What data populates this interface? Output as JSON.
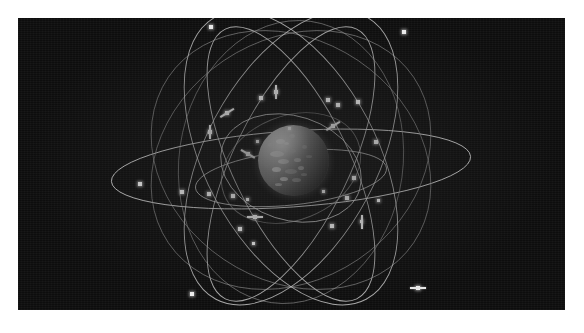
{
  "figure": {
    "kind": "orbital-constellation-illustration",
    "background_color": "#0d0d0d",
    "frame_color": "#ffffff",
    "orbit_stroke_color": "#cfcfcf",
    "satellite_color": "#f2f2f2",
    "earth_color": "#8a8a8a",
    "panel_rect": {
      "x": 18,
      "y": 18,
      "width": 547,
      "height": 292
    }
  },
  "earth": {
    "label": "earth-globe",
    "center_x": 291,
    "center_y": 159,
    "radius": 35,
    "landmasses": [
      {
        "x": 18,
        "y": 14,
        "w": 9,
        "h": 5,
        "dim": false
      },
      {
        "x": 31,
        "y": 9,
        "w": 6,
        "h": 4,
        "dim": true
      },
      {
        "x": 12,
        "y": 26,
        "w": 14,
        "h": 6,
        "dim": false
      },
      {
        "x": 30,
        "y": 24,
        "w": 8,
        "h": 4,
        "dim": true
      },
      {
        "x": 20,
        "y": 34,
        "w": 11,
        "h": 5,
        "dim": false
      },
      {
        "x": 36,
        "y": 33,
        "w": 7,
        "h": 4,
        "dim": false
      },
      {
        "x": 14,
        "y": 42,
        "w": 9,
        "h": 5,
        "dim": false
      },
      {
        "x": 27,
        "y": 44,
        "w": 12,
        "h": 5,
        "dim": true
      },
      {
        "x": 40,
        "y": 41,
        "w": 6,
        "h": 4,
        "dim": false
      },
      {
        "x": 22,
        "y": 52,
        "w": 8,
        "h": 4,
        "dim": false
      },
      {
        "x": 34,
        "y": 53,
        "w": 9,
        "h": 4,
        "dim": true
      },
      {
        "x": 44,
        "y": 20,
        "w": 5,
        "h": 4,
        "dim": true
      },
      {
        "x": 48,
        "y": 30,
        "w": 6,
        "h": 3,
        "dim": true
      },
      {
        "x": 10,
        "y": 18,
        "w": 5,
        "h": 4,
        "dim": true
      },
      {
        "x": 26,
        "y": 17,
        "w": 5,
        "h": 3,
        "dim": false
      },
      {
        "x": 17,
        "y": 58,
        "w": 7,
        "h": 3,
        "dim": true
      },
      {
        "x": 43,
        "y": 48,
        "w": 6,
        "h": 3,
        "dim": true
      }
    ]
  },
  "orbits": [
    {
      "name": "equatorial-ring",
      "cx": 291,
      "cy": 169,
      "rx": 180,
      "ry": 38,
      "rotate": -4,
      "style": "bright"
    },
    {
      "name": "inner-ring",
      "cx": 291,
      "cy": 178,
      "rx": 96,
      "ry": 27,
      "rotate": -6,
      "style": "orbit"
    },
    {
      "name": "polar-ring-a",
      "cx": 291,
      "cy": 164,
      "rx": 58,
      "ry": 150,
      "rotate": 26,
      "style": "orbit"
    },
    {
      "name": "polar-ring-b",
      "cx": 291,
      "cy": 164,
      "rx": 58,
      "ry": 150,
      "rotate": -26,
      "style": "orbit"
    },
    {
      "name": "inclined-ring-c",
      "cx": 291,
      "cy": 160,
      "rx": 148,
      "ry": 120,
      "rotate": 34,
      "style": "dim"
    },
    {
      "name": "inclined-ring-d",
      "cx": 291,
      "cy": 160,
      "rx": 148,
      "ry": 120,
      "rotate": -34,
      "style": "dim"
    },
    {
      "name": "inclined-ring-e",
      "cx": 291,
      "cy": 158,
      "rx": 160,
      "ry": 86,
      "rotate": 62,
      "style": "orbit"
    },
    {
      "name": "inclined-ring-f",
      "cx": 291,
      "cy": 158,
      "rx": 160,
      "ry": 86,
      "rotate": -62,
      "style": "orbit"
    },
    {
      "name": "inner-inclined-g",
      "cx": 291,
      "cy": 168,
      "rx": 72,
      "ry": 52,
      "rotate": 18,
      "style": "orbit"
    },
    {
      "name": "inner-inclined-h",
      "cx": 291,
      "cy": 168,
      "rx": 72,
      "ry": 52,
      "rotate": -22,
      "style": "dim"
    },
    {
      "name": "mid-ring-i",
      "cx": 291,
      "cy": 162,
      "rx": 112,
      "ry": 142,
      "rotate": 8,
      "style": "dim"
    }
  ],
  "satellites": [
    {
      "id": "sat-01",
      "x": 209,
      "y": 25,
      "type": "plain",
      "size": "md"
    },
    {
      "id": "sat-02",
      "x": 402,
      "y": 30,
      "type": "plain",
      "size": "md"
    },
    {
      "id": "sat-03",
      "x": 259,
      "y": 96,
      "type": "plain",
      "size": "md"
    },
    {
      "id": "sat-04",
      "x": 274,
      "y": 90,
      "type": "vpanel",
      "size": "md"
    },
    {
      "id": "sat-05",
      "x": 225,
      "y": 111,
      "type": "diag",
      "size": "md"
    },
    {
      "id": "sat-06",
      "x": 208,
      "y": 130,
      "type": "vpanel",
      "size": "md"
    },
    {
      "id": "sat-07",
      "x": 246,
      "y": 152,
      "type": "diag2",
      "size": "md"
    },
    {
      "id": "sat-08",
      "x": 326,
      "y": 98,
      "type": "plain",
      "size": "md"
    },
    {
      "id": "sat-09",
      "x": 336,
      "y": 103,
      "type": "plain",
      "size": "md"
    },
    {
      "id": "sat-10",
      "x": 356,
      "y": 100,
      "type": "plain",
      "size": "md"
    },
    {
      "id": "sat-11",
      "x": 331,
      "y": 124,
      "type": "diag",
      "size": "md"
    },
    {
      "id": "sat-12",
      "x": 374,
      "y": 140,
      "type": "plain",
      "size": "md"
    },
    {
      "id": "sat-13",
      "x": 288,
      "y": 127,
      "type": "plain",
      "size": "sm"
    },
    {
      "id": "sat-14",
      "x": 256,
      "y": 140,
      "type": "plain",
      "size": "sm"
    },
    {
      "id": "sat-15",
      "x": 138,
      "y": 182,
      "type": "plain",
      "size": "md"
    },
    {
      "id": "sat-16",
      "x": 180,
      "y": 190,
      "type": "plain",
      "size": "md"
    },
    {
      "id": "sat-17",
      "x": 207,
      "y": 192,
      "type": "plain",
      "size": "md"
    },
    {
      "id": "sat-18",
      "x": 231,
      "y": 194,
      "type": "plain",
      "size": "md"
    },
    {
      "id": "sat-19",
      "x": 246,
      "y": 198,
      "type": "plain",
      "size": "sm"
    },
    {
      "id": "sat-20",
      "x": 352,
      "y": 176,
      "type": "plain",
      "size": "md"
    },
    {
      "id": "sat-21",
      "x": 345,
      "y": 196,
      "type": "plain",
      "size": "md"
    },
    {
      "id": "sat-22",
      "x": 360,
      "y": 220,
      "type": "vpanel",
      "size": "sm"
    },
    {
      "id": "sat-23",
      "x": 330,
      "y": 224,
      "type": "plain",
      "size": "md"
    },
    {
      "id": "sat-24",
      "x": 253,
      "y": 215,
      "type": "hpanel",
      "size": "md"
    },
    {
      "id": "sat-25",
      "x": 238,
      "y": 227,
      "type": "plain",
      "size": "md"
    },
    {
      "id": "sat-26",
      "x": 252,
      "y": 242,
      "type": "plain",
      "size": "sm"
    },
    {
      "id": "sat-27",
      "x": 190,
      "y": 292,
      "type": "plain",
      "size": "md"
    },
    {
      "id": "sat-28",
      "x": 416,
      "y": 286,
      "type": "hpanel",
      "size": "md"
    },
    {
      "id": "sat-29",
      "x": 322,
      "y": 190,
      "type": "plain",
      "size": "sm"
    },
    {
      "id": "sat-30",
      "x": 377,
      "y": 199,
      "type": "plain",
      "size": "sm"
    }
  ]
}
